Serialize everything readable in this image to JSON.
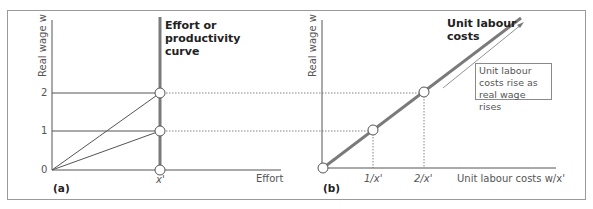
{
  "panels": {
    "a": {
      "tag": "(a)",
      "y_axis_label": "Real wage w",
      "x_axis_label": "Effort",
      "y_ticks": [
        "0",
        "1",
        "2"
      ],
      "x_tick": "x'",
      "curve_label_lines": [
        "Effort or",
        "productivity",
        "curve"
      ]
    },
    "b": {
      "tag": "(b)",
      "y_axis_label": "Real wage w",
      "x_axis_label": "Unit labour costs w/x'",
      "x_ticks": [
        "1/x'",
        "2/x'"
      ],
      "curve_label_lines": [
        "Unit labour",
        "costs"
      ],
      "note_lines": [
        "Unit labour",
        "costs rise as",
        "real wage rises"
      ]
    }
  },
  "colors": {
    "thick_line": "#7a7a7a",
    "thin_line": "#555555",
    "frame": "#9a9a9a"
  }
}
